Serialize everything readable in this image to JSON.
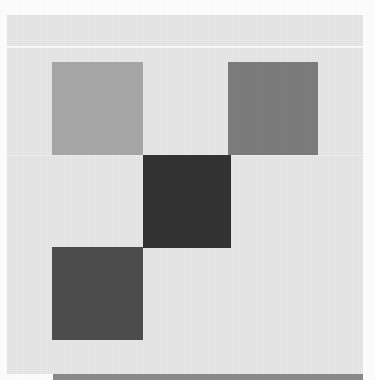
{
  "canvas": {
    "width": 375,
    "height": 380,
    "page_background": "#ffffff"
  },
  "panel": {
    "background": "#e8e8e8",
    "x": 7,
    "y": 15,
    "width": 356,
    "height": 359
  },
  "rules": [
    {
      "name": "upper-separator",
      "color": "#fbfbfb",
      "y": 46
    },
    {
      "name": "mid-separator",
      "color": "#efefef",
      "y": 155
    }
  ],
  "blocks": [
    {
      "name": "top-left-block",
      "color": "#a8a8a8",
      "x": 52,
      "y": 62,
      "width": 91,
      "height": 93
    },
    {
      "name": "top-right-block",
      "color": "#7d7d7d",
      "x": 228,
      "y": 62,
      "width": 90,
      "height": 93
    },
    {
      "name": "center-block",
      "color": "#333333",
      "x": 143,
      "y": 155,
      "width": 88,
      "height": 93
    },
    {
      "name": "bottom-left-block",
      "color": "#4d4d4d",
      "x": 52,
      "y": 247,
      "width": 91,
      "height": 93
    }
  ],
  "bottom_bar": {
    "name": "bottom-bar",
    "color": "#8c8c8c",
    "x": 53,
    "y": 374,
    "width": 310,
    "height": 6
  }
}
